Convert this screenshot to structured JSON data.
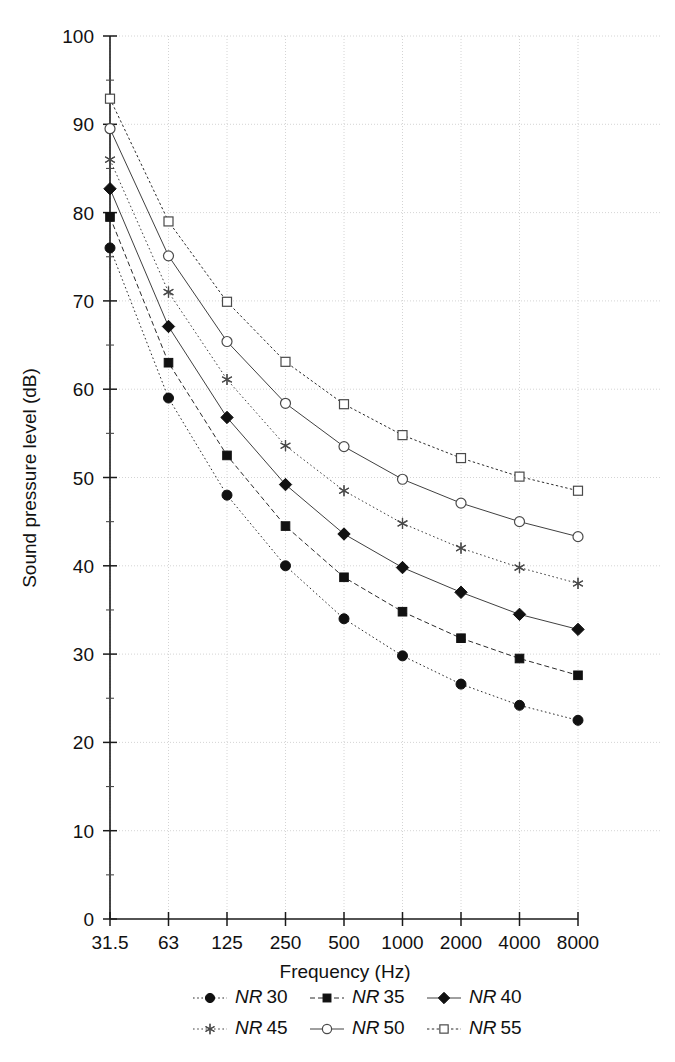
{
  "chart_data": {
    "type": "line",
    "title": "",
    "xlabel": "Frequency (Hz)",
    "ylabel": "Sound pressure level (dB)",
    "categories": [
      "31.5",
      "63",
      "125",
      "250",
      "500",
      "1000",
      "2000",
      "4000",
      "8000"
    ],
    "x_tick_labels": [
      "31.5",
      "63",
      "125",
      "250",
      "500",
      "1000",
      "2000",
      "4000",
      "8000"
    ],
    "y_tick_labels": [
      "0",
      "10",
      "20",
      "30",
      "40",
      "50",
      "60",
      "70",
      "80",
      "90",
      "100"
    ],
    "y_ticks": [
      0,
      10,
      20,
      30,
      40,
      50,
      60,
      70,
      80,
      90,
      100
    ],
    "ylim": [
      0,
      100
    ],
    "grid": true,
    "legend_position": "bottom",
    "series": [
      {
        "name": "NR 30",
        "legend_prefix": "NR",
        "legend_value": "30",
        "marker": "filled-circle",
        "values": [
          76.0,
          59.0,
          48.0,
          40.0,
          34.0,
          29.8,
          26.6,
          24.2,
          22.5
        ]
      },
      {
        "name": "NR 35",
        "legend_prefix": "NR",
        "legend_value": "35",
        "marker": "filled-square",
        "values": [
          79.5,
          63.0,
          52.5,
          44.5,
          38.7,
          34.8,
          31.8,
          29.5,
          27.6
        ]
      },
      {
        "name": "NR 40",
        "legend_prefix": "NR",
        "legend_value": "40",
        "marker": "filled-diamond",
        "values": [
          82.7,
          67.1,
          56.8,
          49.2,
          43.6,
          39.8,
          37.0,
          34.5,
          32.8
        ]
      },
      {
        "name": "NR 45",
        "legend_prefix": "NR",
        "legend_value": "45",
        "marker": "star",
        "values": [
          86.0,
          71.0,
          61.1,
          53.6,
          48.5,
          44.8,
          42.0,
          39.8,
          38.0
        ]
      },
      {
        "name": "NR 50",
        "legend_prefix": "NR",
        "legend_value": "50",
        "marker": "open-circle",
        "values": [
          89.5,
          75.1,
          65.4,
          58.4,
          53.5,
          49.8,
          47.1,
          45.0,
          43.3
        ]
      },
      {
        "name": "NR 55",
        "legend_prefix": "NR",
        "legend_value": "55",
        "marker": "open-square",
        "values": [
          92.9,
          79.0,
          69.9,
          63.1,
          58.3,
          54.8,
          52.2,
          50.1,
          48.5
        ]
      }
    ]
  },
  "axes": {
    "y_title": "Sound pressure level (dB)",
    "x_title": "Frequency (Hz)"
  },
  "legend": {
    "rows": [
      [
        "NR 30",
        "NR 35",
        "NR 40"
      ],
      [
        "NR 45",
        "NR 50",
        "NR 55"
      ]
    ]
  }
}
